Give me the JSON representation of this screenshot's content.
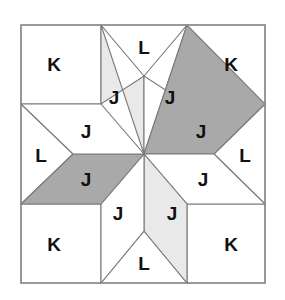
{
  "block": {
    "name": "eight-pointed-star-quilt-block",
    "pattern_title": "LeMoyne Star",
    "canvas": {
      "width": 285,
      "height": 300
    },
    "bounds": {
      "x0": 21,
      "y0": 25,
      "x1": 265,
      "y1": 283
    },
    "grid_x": [
      21,
      101,
      187,
      265
    ],
    "grid_y": [
      25,
      104,
      204,
      283
    ],
    "center": {
      "x": 144,
      "y": 154
    },
    "colors": {
      "background": "#ffffff",
      "patch_white": "#ffffff",
      "patch_light_gray": "#e9e9e9",
      "patch_dark_gray": "#a9a9a9",
      "outline": "#7a7a7a",
      "border": "#8c8c8c",
      "label_text": "#111111"
    },
    "legend": {
      "K": "corner square",
      "L": "edge triangle",
      "J": "star point diamond"
    }
  },
  "patches": [
    {
      "id": "corner-top-left",
      "label": "K",
      "shape": "square",
      "fill": "#ffffff",
      "points": "21,25 101,25 101,104 21,104",
      "label_x": 54,
      "label_y": 64
    },
    {
      "id": "corner-top-right",
      "label": "K",
      "shape": "square",
      "fill": "#ffffff",
      "points": "187,25 265,25 265,104 187,104",
      "label_x": 231,
      "label_y": 64
    },
    {
      "id": "corner-bottom-left",
      "label": "K",
      "shape": "square",
      "fill": "#ffffff",
      "points": "21,204 101,204 101,283 21,283",
      "label_x": 54,
      "label_y": 244
    },
    {
      "id": "corner-bottom-right",
      "label": "K",
      "shape": "square",
      "fill": "#ffffff",
      "points": "187,204 265,204 265,283 187,283",
      "label_x": 231,
      "label_y": 244
    },
    {
      "id": "edge-triangle-top",
      "label": "L",
      "shape": "triangle",
      "fill": "#ffffff",
      "points": "101,25 187,25 144,76",
      "label_x": 144,
      "label_y": 47
    },
    {
      "id": "edge-triangle-left",
      "label": "L",
      "shape": "triangle",
      "fill": "#ffffff",
      "points": "21,104 21,204 73,154",
      "label_x": 41,
      "label_y": 155
    },
    {
      "id": "edge-triangle-right",
      "label": "L",
      "shape": "triangle",
      "fill": "#ffffff",
      "points": "265,104 265,204 214,154",
      "label_x": 245,
      "label_y": 155
    },
    {
      "id": "edge-triangle-bottom",
      "label": "L",
      "shape": "triangle",
      "fill": "#ffffff",
      "points": "101,283 187,283 144,231",
      "label_x": 144,
      "label_y": 263
    },
    {
      "id": "star-point-north",
      "label": "J",
      "shape": "diamond",
      "fill": "#e9e9e9",
      "points": "144,154 101,25 101,104 144,76",
      "label_x": 114,
      "label_y": 97
    },
    {
      "id": "star-point-northeast",
      "label": "J",
      "shape": "diamond",
      "fill": "#ffffff",
      "points": "144,154 144,76 187,104 187,25",
      "label_x": 170,
      "label_y": 97
    },
    {
      "id": "star-point-east-upper",
      "label": "J",
      "shape": "diamond",
      "fill": "#a9a9a9",
      "points": "144,154 187,25 265,104 214,154",
      "label_x": 201,
      "label_y": 131
    },
    {
      "id": "star-point-east-lower",
      "label": "J",
      "shape": "diamond",
      "fill": "#ffffff",
      "points": "144,154 214,154 265,204 187,204",
      "label_x": 203,
      "label_y": 179
    },
    {
      "id": "star-point-south",
      "label": "J",
      "shape": "diamond",
      "fill": "#e9e9e9",
      "points": "144,154 187,204 187,283 144,231",
      "label_x": 172,
      "label_y": 213
    },
    {
      "id": "star-point-southwest",
      "label": "J",
      "shape": "diamond",
      "fill": "#ffffff",
      "points": "144,154 144,231 101,283 101,204",
      "label_x": 118,
      "label_y": 213
    },
    {
      "id": "star-point-west-lower",
      "label": "J",
      "shape": "diamond",
      "fill": "#a9a9a9",
      "points": "144,154 101,204 21,204 73,154",
      "label_x": 86,
      "label_y": 179
    },
    {
      "id": "star-point-west-upper",
      "label": "J",
      "shape": "diamond",
      "fill": "#ffffff",
      "points": "144,154 73,154 21,104 101,104",
      "label_x": 86,
      "label_y": 131
    }
  ]
}
